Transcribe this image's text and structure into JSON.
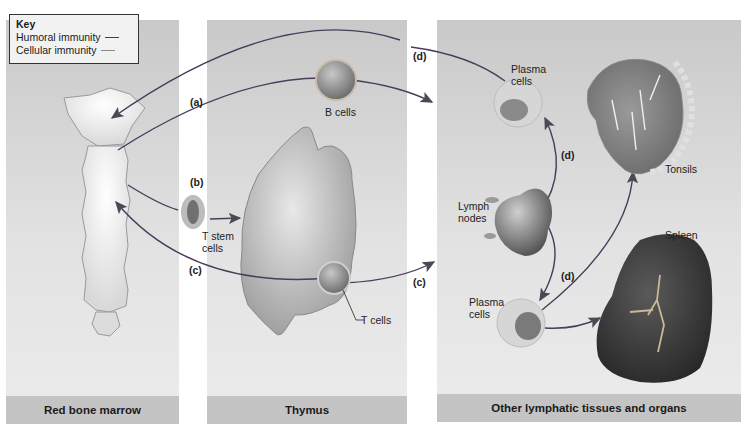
{
  "key": {
    "title": "Key",
    "items": [
      {
        "label": "Humoral immunity",
        "color": "#4a3b5a"
      },
      {
        "label": "Cellular immunity",
        "color": "#8a8a8a"
      }
    ]
  },
  "panels": [
    {
      "id": "marrow",
      "title": "Red bone marrow"
    },
    {
      "id": "thymus",
      "title": "Thymus"
    },
    {
      "id": "other",
      "title": "Other lymphatic tissues and organs"
    }
  ],
  "steps": {
    "a": "(a)",
    "b": "(b)",
    "c": "(c)",
    "c2": "(c)",
    "d1": "(d)",
    "d2": "(d)",
    "d3": "(d)"
  },
  "labels": {
    "b_cells": "B cells",
    "t_stem_cells_1": "T stem",
    "t_stem_cells_2": "cells",
    "t_cells": "T cells",
    "plasma_top_1": "Plasma",
    "plasma_top_2": "cells",
    "lymph_1": "Lymph",
    "lymph_2": "nodes",
    "plasma_bottom_1": "Plasma",
    "plasma_bottom_2": "cells",
    "tonsils": "Tonsils",
    "spleen": "Spleen"
  }
}
